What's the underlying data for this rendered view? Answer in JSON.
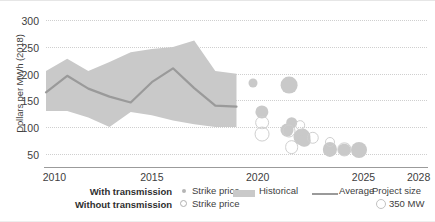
{
  "chart_data": {
    "type": "area",
    "title": "",
    "xlabel": "",
    "ylabel": "Dollars per MWh (2018)",
    "xlim": [
      2010,
      2028
    ],
    "ylim": [
      25,
      310
    ],
    "grid": true,
    "x_ticks": [
      "2010",
      "2015",
      "2020",
      "2025",
      "2028"
    ],
    "x_tick_values": [
      2010,
      2015,
      2020,
      2025,
      2028
    ],
    "y_ticks": [
      "50",
      "100",
      "150",
      "200",
      "250",
      "300"
    ],
    "y_tick_values": [
      50,
      100,
      150,
      200,
      250,
      300
    ],
    "series": [
      {
        "name": "Historical",
        "type": "band",
        "color": "#c9c9c9",
        "x": [
          2010,
          2011,
          2012,
          2013,
          2014,
          2015,
          2016,
          2017,
          2018,
          2019
        ],
        "upper": [
          205,
          228,
          205,
          222,
          240,
          246,
          250,
          262,
          205,
          200
        ],
        "lower": [
          130,
          130,
          118,
          100,
          128,
          122,
          112,
          105,
          100,
          100
        ]
      },
      {
        "name": "Average",
        "type": "line",
        "color": "#9a9a9a",
        "x": [
          2010,
          2011,
          2012,
          2013,
          2014,
          2015,
          2016,
          2017,
          2018,
          2019
        ],
        "values": [
          165,
          196,
          172,
          157,
          146,
          184,
          210,
          173,
          140,
          138
        ]
      },
      {
        "name": "Strike price (with transmission)",
        "type": "bubble",
        "marker": "filled",
        "color": "#c9c9c9",
        "points": [
          {
            "x": 2019.8,
            "y": 182,
            "size": 120
          },
          {
            "x": 2020.2,
            "y": 128,
            "size": 260
          },
          {
            "x": 2021.5,
            "y": 178,
            "size": 420
          },
          {
            "x": 2021.6,
            "y": 108,
            "size": 200
          },
          {
            "x": 2021.4,
            "y": 94,
            "size": 250
          },
          {
            "x": 2022.1,
            "y": 82,
            "size": 430
          },
          {
            "x": 2022.2,
            "y": 74,
            "size": 230
          },
          {
            "x": 2023.4,
            "y": 58,
            "size": 300
          },
          {
            "x": 2024.1,
            "y": 57,
            "size": 230
          },
          {
            "x": 2024.8,
            "y": 56,
            "size": 380
          }
        ]
      },
      {
        "name": "Strike price (without transmission)",
        "type": "bubble",
        "marker": "open",
        "color": "#cfcfcf",
        "points": [
          {
            "x": 2020.2,
            "y": 108,
            "size": 280
          },
          {
            "x": 2020.2,
            "y": 86,
            "size": 330
          },
          {
            "x": 2021.5,
            "y": 92,
            "size": 250
          },
          {
            "x": 2021.6,
            "y": 62,
            "size": 280
          },
          {
            "x": 2022.0,
            "y": 104,
            "size": 140
          },
          {
            "x": 2022.6,
            "y": 80,
            "size": 230
          },
          {
            "x": 2023.4,
            "y": 72,
            "size": 150
          },
          {
            "x": 2024.1,
            "y": 58,
            "size": 260
          }
        ]
      }
    ],
    "annotations": []
  },
  "axes": {
    "y_title": "Dollars per MWh (2018)"
  },
  "legend": {
    "position": "bottom",
    "row_labels": {
      "with_transmission": "With transmission",
      "without_transmission": "Without transmission"
    },
    "strike_price_label_1": "Strike price",
    "strike_price_label_2": "Strike price",
    "historical_label": "Historical",
    "average_label": "Average",
    "project_size_title": "Project size",
    "project_size_value": "350 MW"
  },
  "colors": {
    "band": "#c9c9c9",
    "average_line": "#9a9a9a",
    "bubble_fill": "#c9c9c9",
    "bubble_stroke": "#cfcfcf",
    "gridline": "#cfcfcf",
    "axis": "#9b9b9b",
    "text": "#3d3d3d"
  }
}
